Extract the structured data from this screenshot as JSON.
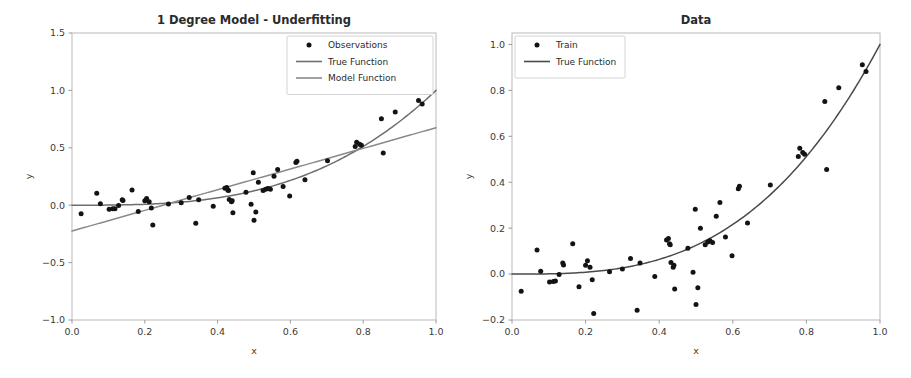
{
  "figure": {
    "width": 911,
    "height": 378,
    "background": "#ffffff"
  },
  "chart_data": [
    {
      "type": "scatter",
      "panel": "left",
      "title": "1 Degree Model - Underfitting",
      "xlabel": "x",
      "ylabel": "y",
      "xlim": [
        0.0,
        1.0
      ],
      "ylim": [
        -1.0,
        1.5
      ],
      "xticks": [
        "0.0",
        "0.2",
        "0.4",
        "0.6",
        "0.8",
        "1.0"
      ],
      "xtick_values": [
        0.0,
        0.2,
        0.4,
        0.6,
        0.8,
        1.0
      ],
      "yticks": [
        "-1.0",
        "-0.5",
        "0.0",
        "0.5",
        "1.0",
        "1.5"
      ],
      "ytick_values": [
        -1.0,
        -0.5,
        0.0,
        0.5,
        1.0,
        1.5
      ],
      "grid": false,
      "legend_position": "upper right",
      "legend": [
        {
          "label": "Observations",
          "marker": "dot",
          "color": "#131313"
        },
        {
          "label": "True Function",
          "marker": "line",
          "color": "#6e6e6e"
        },
        {
          "label": "Model Function",
          "marker": "line",
          "color": "#8a8a8a"
        }
      ],
      "series": [
        {
          "name": "Observations",
          "marker": "dot",
          "color": "#131313",
          "points": [
            [
              0.025,
              -0.075
            ],
            [
              0.068,
              0.105
            ],
            [
              0.078,
              0.012
            ],
            [
              0.102,
              -0.035
            ],
            [
              0.112,
              -0.032
            ],
            [
              0.118,
              -0.03
            ],
            [
              0.128,
              -0.002
            ],
            [
              0.138,
              0.048
            ],
            [
              0.14,
              0.04
            ],
            [
              0.165,
              0.132
            ],
            [
              0.182,
              -0.055
            ],
            [
              0.2,
              0.038
            ],
            [
              0.205,
              0.058
            ],
            [
              0.212,
              0.03
            ],
            [
              0.218,
              -0.025
            ],
            [
              0.222,
              -0.172
            ],
            [
              0.265,
              0.01
            ],
            [
              0.3,
              0.022
            ],
            [
              0.322,
              0.068
            ],
            [
              0.34,
              -0.158
            ],
            [
              0.348,
              0.048
            ],
            [
              0.388,
              -0.01
            ],
            [
              0.42,
              0.148
            ],
            [
              0.425,
              0.155
            ],
            [
              0.428,
              0.132
            ],
            [
              0.43,
              0.128
            ],
            [
              0.432,
              0.05
            ],
            [
              0.438,
              0.03
            ],
            [
              0.44,
              0.038
            ],
            [
              0.442,
              -0.065
            ],
            [
              0.478,
              0.112
            ],
            [
              0.492,
              0.008
            ],
            [
              0.498,
              0.282
            ],
            [
              0.5,
              -0.132
            ],
            [
              0.505,
              -0.06
            ],
            [
              0.512,
              0.2
            ],
            [
              0.525,
              0.128
            ],
            [
              0.532,
              0.14
            ],
            [
              0.538,
              0.145
            ],
            [
              0.545,
              0.138
            ],
            [
              0.555,
              0.252
            ],
            [
              0.565,
              0.312
            ],
            [
              0.58,
              0.162
            ],
            [
              0.598,
              0.08
            ],
            [
              0.615,
              0.372
            ],
            [
              0.618,
              0.382
            ],
            [
              0.64,
              0.222
            ],
            [
              0.702,
              0.388
            ],
            [
              0.778,
              0.512
            ],
            [
              0.782,
              0.548
            ],
            [
              0.79,
              0.53
            ],
            [
              0.795,
              0.522
            ],
            [
              0.85,
              0.752
            ],
            [
              0.855,
              0.455
            ],
            [
              0.888,
              0.812
            ],
            [
              0.952,
              0.912
            ],
            [
              0.962,
              0.882
            ]
          ]
        },
        {
          "name": "True Function",
          "type": "line",
          "color": "#6e6e6e",
          "expression": "y = x^3",
          "samples": [
            [
              0.0,
              0.0
            ],
            [
              0.1,
              0.001
            ],
            [
              0.2,
              0.008
            ],
            [
              0.3,
              0.027
            ],
            [
              0.4,
              0.064
            ],
            [
              0.5,
              0.125
            ],
            [
              0.6,
              0.216
            ],
            [
              0.7,
              0.343
            ],
            [
              0.8,
              0.512
            ],
            [
              0.9,
              0.729
            ],
            [
              1.0,
              1.0
            ]
          ]
        },
        {
          "name": "Model Function",
          "type": "line",
          "color": "#8a8a8a",
          "expression": "y = 0.9x - 0.225 (degree 1 fit)",
          "samples": [
            [
              0.0,
              -0.225
            ],
            [
              0.25,
              0.0
            ],
            [
              0.5,
              0.225
            ],
            [
              0.75,
              0.45
            ],
            [
              1.0,
              0.675
            ]
          ]
        }
      ]
    },
    {
      "type": "scatter",
      "panel": "right",
      "title": "Data",
      "xlabel": "x",
      "ylabel": "y",
      "xlim": [
        0.0,
        1.0
      ],
      "ylim": [
        -0.2,
        1.05
      ],
      "xticks": [
        "0.0",
        "0.2",
        "0.4",
        "0.6",
        "0.8",
        "1.0"
      ],
      "xtick_values": [
        0.0,
        0.2,
        0.4,
        0.6,
        0.8,
        1.0
      ],
      "yticks": [
        "-0.2",
        "0.0",
        "0.2",
        "0.4",
        "0.6",
        "0.8",
        "1.0"
      ],
      "ytick_values": [
        -0.2,
        0.0,
        0.2,
        0.4,
        0.6,
        0.8,
        1.0
      ],
      "grid": false,
      "legend_position": "upper left",
      "legend": [
        {
          "label": "Train",
          "marker": "dot",
          "color": "#131313"
        },
        {
          "label": "True Function",
          "marker": "line",
          "color": "#4a4a4a"
        }
      ],
      "series": [
        {
          "name": "Train",
          "marker": "dot",
          "color": "#131313",
          "points": [
            [
              0.025,
              -0.075
            ],
            [
              0.068,
              0.105
            ],
            [
              0.078,
              0.012
            ],
            [
              0.102,
              -0.035
            ],
            [
              0.112,
              -0.032
            ],
            [
              0.118,
              -0.03
            ],
            [
              0.128,
              -0.002
            ],
            [
              0.138,
              0.048
            ],
            [
              0.14,
              0.04
            ],
            [
              0.165,
              0.132
            ],
            [
              0.182,
              -0.055
            ],
            [
              0.2,
              0.038
            ],
            [
              0.205,
              0.058
            ],
            [
              0.212,
              0.03
            ],
            [
              0.218,
              -0.025
            ],
            [
              0.222,
              -0.172
            ],
            [
              0.265,
              0.01
            ],
            [
              0.3,
              0.022
            ],
            [
              0.322,
              0.068
            ],
            [
              0.34,
              -0.158
            ],
            [
              0.348,
              0.048
            ],
            [
              0.388,
              -0.01
            ],
            [
              0.42,
              0.148
            ],
            [
              0.425,
              0.155
            ],
            [
              0.428,
              0.132
            ],
            [
              0.43,
              0.128
            ],
            [
              0.432,
              0.05
            ],
            [
              0.438,
              0.03
            ],
            [
              0.44,
              0.038
            ],
            [
              0.442,
              -0.065
            ],
            [
              0.478,
              0.112
            ],
            [
              0.492,
              0.008
            ],
            [
              0.498,
              0.282
            ],
            [
              0.5,
              -0.132
            ],
            [
              0.505,
              -0.06
            ],
            [
              0.512,
              0.2
            ],
            [
              0.525,
              0.128
            ],
            [
              0.532,
              0.14
            ],
            [
              0.538,
              0.145
            ],
            [
              0.545,
              0.138
            ],
            [
              0.555,
              0.252
            ],
            [
              0.565,
              0.312
            ],
            [
              0.58,
              0.162
            ],
            [
              0.598,
              0.08
            ],
            [
              0.615,
              0.372
            ],
            [
              0.618,
              0.382
            ],
            [
              0.64,
              0.222
            ],
            [
              0.702,
              0.388
            ],
            [
              0.778,
              0.512
            ],
            [
              0.782,
              0.548
            ],
            [
              0.79,
              0.53
            ],
            [
              0.795,
              0.522
            ],
            [
              0.85,
              0.752
            ],
            [
              0.855,
              0.455
            ],
            [
              0.888,
              0.812
            ],
            [
              0.952,
              0.912
            ],
            [
              0.962,
              0.882
            ]
          ]
        },
        {
          "name": "True Function",
          "type": "line",
          "color": "#4a4a4a",
          "expression": "y = x^3",
          "samples": [
            [
              0.0,
              0.0
            ],
            [
              0.1,
              0.001
            ],
            [
              0.2,
              0.008
            ],
            [
              0.3,
              0.027
            ],
            [
              0.4,
              0.064
            ],
            [
              0.5,
              0.125
            ],
            [
              0.6,
              0.216
            ],
            [
              0.7,
              0.343
            ],
            [
              0.8,
              0.512
            ],
            [
              0.9,
              0.729
            ],
            [
              1.0,
              1.0
            ]
          ]
        }
      ]
    }
  ]
}
